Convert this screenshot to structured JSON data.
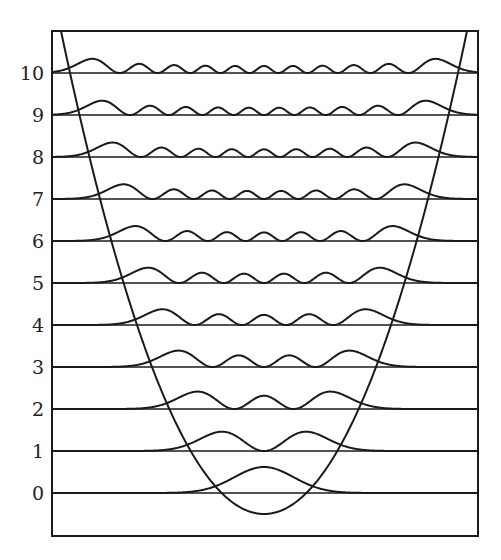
{
  "diagram": {
    "type": "harmonic-oscillator-probability-densities",
    "levels": [
      0,
      1,
      2,
      3,
      4,
      5,
      6,
      7,
      8,
      9,
      10
    ],
    "level_labels": [
      "0",
      "1",
      "2",
      "3",
      "4",
      "5",
      "6",
      "7",
      "8",
      "9",
      "10"
    ],
    "potential": "parabola",
    "colors": {
      "line": "#1a1a1a",
      "background": "#ffffff"
    }
  },
  "chart_data": {
    "type": "line",
    "title": "",
    "xlabel": "",
    "ylabel": "",
    "y_tick_labels": [
      "0",
      "1",
      "2",
      "3",
      "4",
      "5",
      "6",
      "7",
      "8",
      "9",
      "10"
    ],
    "series": [
      {
        "name": "potential V(x)",
        "shape": "parabola"
      },
      {
        "name": "|psi_n|^2 for n = 0..10",
        "offset_by_level": true
      }
    ],
    "grid": false,
    "legend": "none"
  }
}
